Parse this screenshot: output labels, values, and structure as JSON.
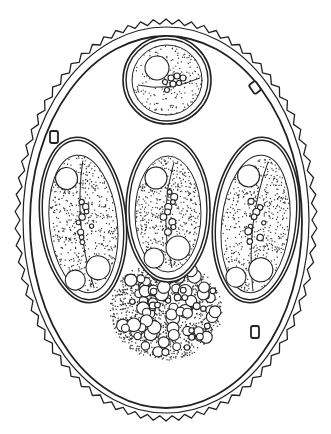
{
  "figure": {
    "stroke_color": "#222222",
    "background": "#ffffff",
    "stipple_color": "#333333",
    "oocyst": {
      "center": [
        166,
        220
      ],
      "outer_wavy_wall": {
        "rx": 146,
        "ry": 196,
        "teeth": 74
      },
      "inner_wall": {
        "rx": 136,
        "ry": 186
      }
    },
    "sporocysts": [
      {
        "id": "top-round",
        "shape": "circle",
        "cx": 167,
        "cy": 80,
        "r": 44
      },
      {
        "id": "left",
        "shape": "ellipse",
        "cx": 83,
        "cy": 220,
        "rx": 43,
        "ry": 83,
        "rotate": -6
      },
      {
        "id": "middle",
        "shape": "ellipse",
        "cx": 168,
        "cy": 210,
        "rx": 42,
        "ry": 72,
        "rotate": 0
      },
      {
        "id": "right",
        "shape": "ellipse",
        "cx": 256,
        "cy": 220,
        "rx": 43,
        "ry": 83,
        "rotate": 6
      }
    ],
    "polar_granules": [
      {
        "x": 251,
        "y": 82,
        "w": 8,
        "h": 11,
        "rotate": -35
      },
      {
        "x": 50,
        "y": 131,
        "w": 8,
        "h": 12,
        "rotate": 0
      },
      {
        "x": 251,
        "y": 326,
        "w": 8,
        "h": 12,
        "rotate": 0
      }
    ],
    "residual_body": {
      "cx": 166,
      "cy": 310,
      "rx": 56,
      "ry": 50
    }
  }
}
